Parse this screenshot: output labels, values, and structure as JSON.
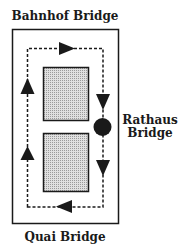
{
  "diagram": {
    "type": "one-way traffic loop around two blocks",
    "labels": {
      "top": "Bahnhof Bridge",
      "right_line1": "Rathaus",
      "right_line2": "Bridge",
      "bottom": "Quai Bridge"
    },
    "colors": {
      "stroke": "#1a1a1a",
      "block_fill": "#c8c8c8",
      "background": "#ffffff"
    },
    "elements": {
      "outer_boundary": "rectangle",
      "blocks": [
        "upper-block",
        "lower-block"
      ],
      "route": "dashed clockwise loop",
      "arrows": [
        "right (top)",
        "down (right upper)",
        "down (right lower)",
        "left (bottom)",
        "up (left lower)",
        "up (left upper)"
      ],
      "marker": "filled circle on right side at Rathaus Bridge"
    }
  }
}
